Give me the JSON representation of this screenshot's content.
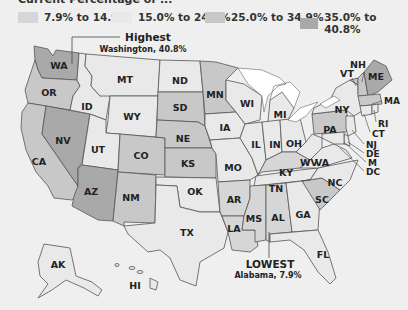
{
  "title": "Current Percentage of ...",
  "legend": [
    {
      "label": "7.9% to 14.9%",
      "color": "#d6d6d6"
    },
    {
      "label": "15.0% to 24.9%",
      "color": "#e9e9e9"
    },
    {
      "label": "25.0% to 34.9%",
      "color": "#c8c8c8"
    },
    {
      "label": "35.0% to 40.8%",
      "color": "#a9a9a9"
    }
  ],
  "annotations": {
    "highest": {
      "title": "Highest",
      "detail": "Washington, 40.8%"
    },
    "lowest": {
      "title": "LOWEST",
      "detail": "Alabama, 7.9%"
    }
  },
  "colors": {
    "background": "#efefef",
    "lakes": "#ffffff",
    "c1": "#d6d6d6",
    "c2": "#e9e9e9",
    "c3": "#c8c8c8",
    "c4": "#a9a9a9"
  },
  "states": {
    "WA": "WA",
    "OR": "OR",
    "CA": "CA",
    "NV": "NV",
    "ID": "ID",
    "MT": "MT",
    "WY": "WY",
    "UT": "UT",
    "AZ": "AZ",
    "CO": "CO",
    "NM": "NM",
    "ND": "ND",
    "SD": "SD",
    "NE": "NE",
    "KS": "KS",
    "OK": "OK",
    "TX": "TX",
    "MN": "MN",
    "IA": "IA",
    "MO": "MO",
    "AR": "AR",
    "LA": "LA",
    "WI": "WI",
    "IL": "IL",
    "MI": "MI",
    "IN": "IN",
    "OH": "OH",
    "KY": "KY",
    "TN": "TN",
    "MS": "MS",
    "AL": "AL",
    "GA": "GA",
    "FL": "FL",
    "SC": "SC",
    "NC": "NC",
    "VA": "VA",
    "WV": "WV",
    "PA": "PA",
    "NY": "NY",
    "VT": "VT",
    "NH": "NH",
    "ME": "ME",
    "MA": "MA",
    "RI": "RI",
    "CT": "CT",
    "NJ": "NJ",
    "DE": "DE",
    "MD": "M",
    "DC": "DC",
    "AK": "AK",
    "HI": "HI"
  }
}
